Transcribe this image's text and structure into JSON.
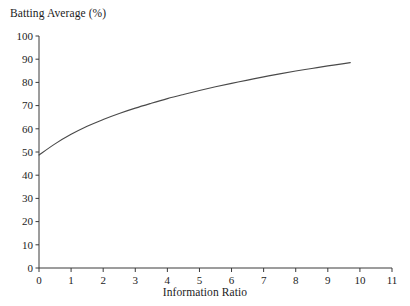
{
  "chart_data": {
    "type": "line",
    "title": "",
    "xlabel": "Information Ratio",
    "ylabel": "Batting Average (%)",
    "xlim": [
      0,
      11
    ],
    "ylim": [
      0,
      100
    ],
    "grid": false,
    "legend": "none",
    "xticks": [
      "0",
      "1",
      "2",
      "3",
      "4",
      "5",
      "6",
      "7",
      "8",
      "9",
      "10",
      "11"
    ],
    "yticks": [
      "0",
      "10",
      "20",
      "30",
      "40",
      "50",
      "60",
      "70",
      "80",
      "90",
      "100"
    ],
    "series": [
      {
        "name": "Batting Average",
        "x": [
          0.0,
          0.5,
          1.0,
          1.5,
          2.0,
          2.5,
          3.0,
          3.5,
          4.0,
          4.5,
          5.0,
          5.5,
          6.0,
          6.5,
          7.0,
          7.5,
          8.0,
          8.5,
          9.0,
          9.5,
          9.7
        ],
        "values": [
          48.7,
          53.5,
          57.6,
          61.1,
          64.0,
          66.6,
          68.9,
          71.0,
          73.0,
          74.8,
          76.5,
          78.1,
          79.6,
          81.0,
          82.4,
          83.7,
          84.9,
          86.0,
          87.1,
          88.1,
          88.5
        ]
      }
    ],
    "annotations": []
  },
  "axis_titles": {
    "y": "Batting Average (%)",
    "x": "Information Ratio"
  }
}
